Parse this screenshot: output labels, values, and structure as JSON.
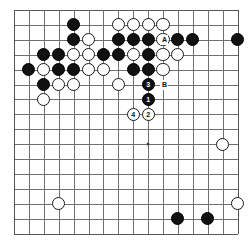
{
  "board": {
    "title": "Go board diagram",
    "columns": 16,
    "rows": 16,
    "line_color": "#6f6f6f",
    "black_color": "#111111",
    "white_color": "#ffffff",
    "origin_x": 14,
    "origin_y": 10,
    "spacing": 14.9,
    "stone_radius": 6.6,
    "hoshi": [
      {
        "col": 9,
        "row": 9
      },
      {
        "col": 9,
        "row": 3
      }
    ],
    "stones": [
      {
        "col": 4,
        "row": 1,
        "color": "black"
      },
      {
        "col": 7,
        "row": 1,
        "color": "white"
      },
      {
        "col": 8,
        "row": 1,
        "color": "white"
      },
      {
        "col": 9,
        "row": 1,
        "color": "white"
      },
      {
        "col": 10,
        "row": 1,
        "color": "white"
      },
      {
        "col": 4,
        "row": 2,
        "color": "black"
      },
      {
        "col": 5,
        "row": 2,
        "color": "white"
      },
      {
        "col": 7,
        "row": 2,
        "color": "black"
      },
      {
        "col": 8,
        "row": 2,
        "color": "black"
      },
      {
        "col": 9,
        "row": 2,
        "color": "black"
      },
      {
        "col": 10,
        "row": 2,
        "color": "white"
      },
      {
        "col": 2,
        "row": 3,
        "color": "black"
      },
      {
        "col": 3,
        "row": 3,
        "color": "black"
      },
      {
        "col": 4,
        "row": 3,
        "color": "white"
      },
      {
        "col": 5,
        "row": 3,
        "color": "white"
      },
      {
        "col": 6,
        "row": 3,
        "color": "black"
      },
      {
        "col": 7,
        "row": 3,
        "color": "black"
      },
      {
        "col": 8,
        "row": 3,
        "color": "white"
      },
      {
        "col": 9,
        "row": 3,
        "color": "black"
      },
      {
        "col": 10,
        "row": 3,
        "color": "white"
      },
      {
        "col": 1,
        "row": 4,
        "color": "black"
      },
      {
        "col": 2,
        "row": 4,
        "color": "white"
      },
      {
        "col": 3,
        "row": 4,
        "color": "black"
      },
      {
        "col": 4,
        "row": 4,
        "color": "black"
      },
      {
        "col": 5,
        "row": 4,
        "color": "white"
      },
      {
        "col": 6,
        "row": 4,
        "color": "white"
      },
      {
        "col": 8,
        "row": 4,
        "color": "black"
      },
      {
        "col": 9,
        "row": 4,
        "color": "black"
      },
      {
        "col": 10,
        "row": 4,
        "color": "white"
      },
      {
        "col": 2,
        "row": 5,
        "color": "black"
      },
      {
        "col": 3,
        "row": 5,
        "color": "white"
      },
      {
        "col": 4,
        "row": 5,
        "color": "white"
      },
      {
        "col": 7,
        "row": 5,
        "color": "white"
      },
      {
        "col": 9,
        "row": 5,
        "color": "black",
        "label": "3"
      },
      {
        "col": 2,
        "row": 6,
        "color": "white"
      },
      {
        "col": 9,
        "row": 6,
        "color": "black",
        "label": "1"
      },
      {
        "col": 8,
        "row": 7,
        "color": "white",
        "label": "4"
      },
      {
        "col": 9,
        "row": 7,
        "color": "white",
        "label": "2"
      },
      {
        "col": 11,
        "row": 2,
        "color": "black"
      },
      {
        "col": 12,
        "row": 2,
        "color": "black"
      },
      {
        "col": 15,
        "row": 2,
        "color": "black"
      },
      {
        "col": 11,
        "row": 3,
        "color": "white"
      },
      {
        "col": 14,
        "row": 9,
        "color": "white"
      },
      {
        "col": 15,
        "row": 13,
        "color": "white"
      },
      {
        "col": 3,
        "row": 13,
        "color": "white"
      },
      {
        "col": 11,
        "row": 14,
        "color": "black"
      },
      {
        "col": 13,
        "row": 14,
        "color": "black"
      }
    ],
    "markers": [
      {
        "col": 10.1,
        "row": 2,
        "text": "A"
      },
      {
        "col": 10.1,
        "row": 5,
        "text": "B"
      }
    ]
  }
}
